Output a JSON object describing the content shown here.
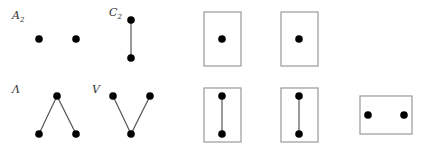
{
  "diagram": {
    "graphs": [
      {
        "id": "A2",
        "label": "A",
        "subscript": "2",
        "nodes": 2,
        "edges": 0,
        "shape": "two isolated vertices"
      },
      {
        "id": "C2",
        "label": "C",
        "subscript": "2",
        "nodes": 2,
        "edges": 1,
        "shape": "vertical edge"
      },
      {
        "id": "Lambda",
        "label": "Λ",
        "subscript": "",
        "nodes": 3,
        "edges": 2,
        "shape": "one top vertex joined to two bottom vertices"
      },
      {
        "id": "V",
        "label": "V",
        "subscript": "",
        "nodes": 3,
        "edges": 2,
        "shape": "two top vertices joined to one bottom vertex"
      }
    ],
    "framed_pieces": [
      {
        "id": "box-single-1",
        "nodes": 1,
        "edges": 0,
        "orientation": "portrait"
      },
      {
        "id": "box-single-2",
        "nodes": 1,
        "edges": 0,
        "orientation": "portrait"
      },
      {
        "id": "box-edge-1",
        "nodes": 2,
        "edges": 1,
        "orientation": "portrait"
      },
      {
        "id": "box-edge-2",
        "nodes": 2,
        "edges": 1,
        "orientation": "portrait"
      },
      {
        "id": "box-pair",
        "nodes": 2,
        "edges": 0,
        "orientation": "landscape"
      }
    ]
  }
}
